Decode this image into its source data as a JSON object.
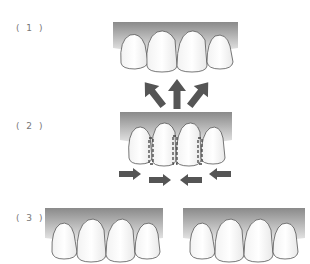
{
  "steps": [
    {
      "label": "( 1 )",
      "description": "teeth with gaps, arrows pointing up"
    },
    {
      "label": "( 2 )",
      "description": "interproximal reduction / closing gaps, horizontal arrows inward"
    },
    {
      "label": "( 3 )",
      "description": "result comparison: two sets of upper front teeth"
    }
  ],
  "colors": {
    "gum_top": "#8a8a8a",
    "gum_bottom": "#e6e6e6",
    "tooth_fill": "#ffffff",
    "tooth_outline": "#555555",
    "arrow": "#555555",
    "label": "#777777"
  }
}
